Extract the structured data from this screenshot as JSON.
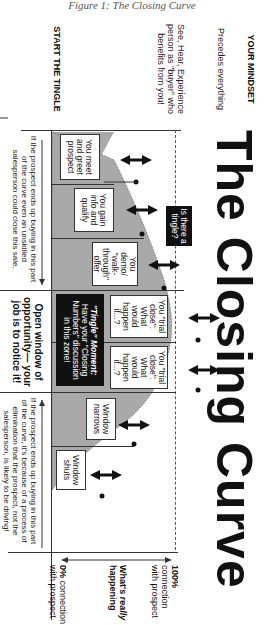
{
  "caption": "Figure 1: The Closing Curve",
  "diagram": {
    "title": "The Closing Curve",
    "left_column": {
      "heading": "YOUR MINDSET",
      "subheading": "Precedes everything",
      "body": "See, Hear, Experience person as \"buyer\" who benefits from you!",
      "start_label": "START THE TINGLE"
    },
    "stages": [
      {
        "label": "You meet and greet prospect"
      },
      {
        "label": "You gain info and qualify"
      },
      {
        "label": "You demo/ \"walk-through\" offer"
      },
      {
        "label": "You \"trial close\": What would happen if...?"
      },
      {
        "label": "You \"trial close\": What would happen if...?"
      },
      {
        "label": "Window narrows"
      },
      {
        "label": "Window shuts"
      }
    ],
    "tingle_question": "Is there a tingle?",
    "tingle_moment": {
      "bold": "\"Tingle\" Moment:",
      "text": "Have your \"Closing Numbers\" discussion in this zone!"
    },
    "bottom_notes": {
      "left": "If the prospect ends up buying in this part of the curve even an unskilled salesperson could close this sale.",
      "center": "Open window of opportunity— your job is to notice it!",
      "right": "If the prospect ends up buying in this part of the curve, it's because of a process of elimination that the prospect, not the salesperson, is likely to be driving!"
    },
    "axis": {
      "top_label_bold": "100%",
      "top_label": "connection with prospect",
      "middle_label_bold": "What's",
      "middle_label_italic": "really",
      "middle_label_tail": "happening",
      "bottom_label_bold": "0%",
      "bottom_label": "connection with prospect"
    },
    "colors": {
      "curve_fill": "#a9a9a9",
      "ink": "#111111",
      "box_border": "#333333"
    }
  }
}
